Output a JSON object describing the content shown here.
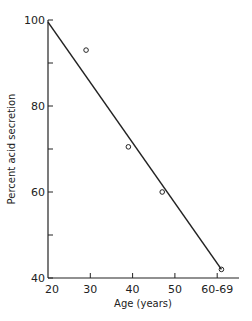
{
  "chart_data": {
    "type": "scatter",
    "title": "",
    "xlabel": "Age (years)",
    "ylabel": "Percent acid secretion",
    "xlim": [
      20,
      65
    ],
    "ylim": [
      40,
      100
    ],
    "x_ticks": [
      {
        "value": 20,
        "label": "20"
      },
      {
        "value": 30,
        "label": "30"
      },
      {
        "value": 40,
        "label": "40"
      },
      {
        "value": 50,
        "label": "50"
      },
      {
        "value": 60,
        "label": "60-69"
      }
    ],
    "y_ticks": [
      {
        "value": 40,
        "label": "40"
      },
      {
        "value": 50,
        "label": ""
      },
      {
        "value": 60,
        "label": "60"
      },
      {
        "value": 70,
        "label": ""
      },
      {
        "value": 80,
        "label": "80"
      },
      {
        "value": 90,
        "label": ""
      },
      {
        "value": 100,
        "label": "100"
      }
    ],
    "grid": false,
    "legend": null,
    "series": [
      {
        "name": "Observed",
        "marker": "open-circle",
        "points": [
          {
            "x": 29,
            "y": 93
          },
          {
            "x": 39,
            "y": 70.5
          },
          {
            "x": 47,
            "y": 60
          },
          {
            "x": 61,
            "y": 42
          }
        ]
      },
      {
        "name": "Regression line",
        "style": "line",
        "points": [
          {
            "x": 20,
            "y": 99.5
          },
          {
            "x": 61,
            "y": 42
          }
        ]
      }
    ],
    "colors": {
      "ink": "#222222",
      "background": "#ffffff"
    }
  }
}
